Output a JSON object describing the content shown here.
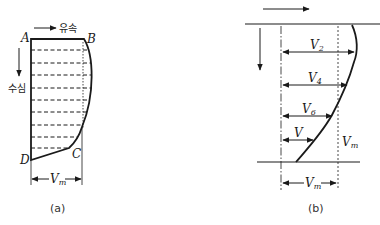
{
  "panel_a": {
    "caption": "(a)",
    "points": {
      "A": "A",
      "B": "B",
      "C": "C",
      "D": "D"
    },
    "flow_label": "유속",
    "depth_label": "수심",
    "mean_velocity_label": "V",
    "mean_velocity_subscript": "m"
  },
  "panel_b": {
    "caption": "(b)",
    "velocity_labels": [
      {
        "main": "V",
        "sub": "2"
      },
      {
        "main": "V",
        "sub": "4"
      },
      {
        "main": "V",
        "sub": "6"
      },
      {
        "main": "V",
        "sub": ""
      }
    ],
    "mean_velocity_side_label": "V",
    "mean_velocity_side_subscript": "m",
    "mean_velocity_bottom_label": "V",
    "mean_velocity_bottom_subscript": "m"
  },
  "colors": {
    "line": "#1a1a1a",
    "background": "#ffffff"
  }
}
